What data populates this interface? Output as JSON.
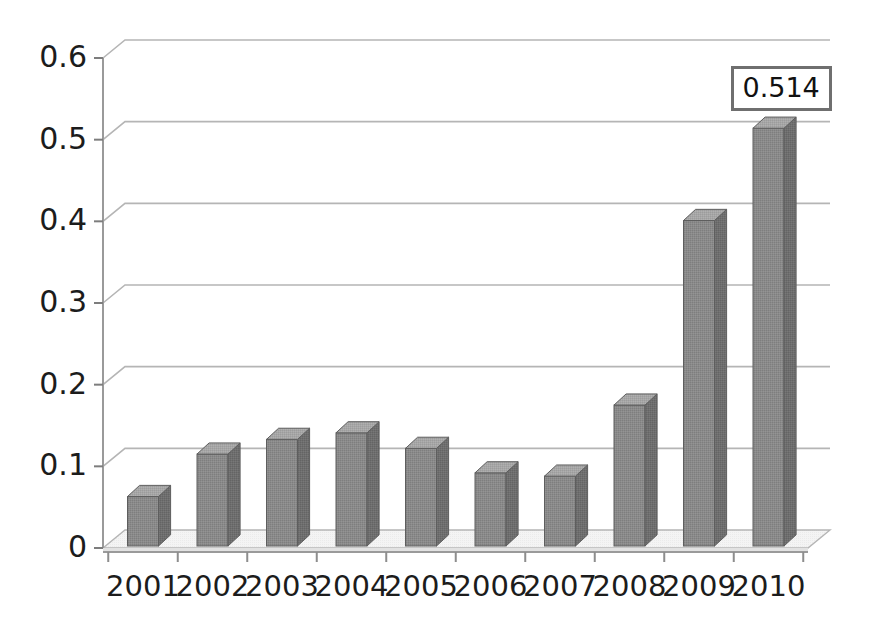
{
  "chart_data": {
    "type": "bar",
    "title": "",
    "subtitle": "",
    "xlabel": "",
    "ylabel": "",
    "categories": [
      "2001",
      "2002",
      "2003",
      "2004",
      "2005",
      "2006",
      "2007",
      "2008",
      "2009",
      "2010"
    ],
    "values": [
      0.063,
      0.115,
      0.133,
      0.141,
      0.122,
      0.092,
      0.088,
      0.175,
      0.401,
      0.514
    ],
    "ylim": [
      0,
      0.6
    ],
    "ytick_values": [
      0,
      0.1,
      0.2,
      0.3,
      0.4,
      0.5,
      0.6
    ],
    "ytick_labels": [
      "0",
      "0.1",
      "0.2",
      "0.3",
      "0.4",
      "0.5",
      "0.6"
    ],
    "grid": true,
    "grid_axis": "y",
    "legend": false,
    "legend_position": "none",
    "style": "3d-column",
    "annotations": [
      {
        "text": "0.514",
        "category": "2010",
        "value": 0.514,
        "kind": "data-label-box"
      }
    ]
  },
  "colors": {
    "background": "#ffffff",
    "bar_front": "#8a8a8a",
    "bar_side": "#6e6e6e",
    "bar_top": "#a6a6a6",
    "bar_edge": "#5e5e5e",
    "gridline": "#b5b5b5",
    "axis_line": "#9a9a9a",
    "floor_top": "#f2f2f2",
    "floor_side": "#e2e2e2",
    "tick_text": "#1c1c1c",
    "label_box_border": "#6f6f6f",
    "label_box_fill": "#ffffff"
  },
  "axis": {
    "y_axis_name": "value-axis",
    "x_axis_name": "category-axis"
  }
}
